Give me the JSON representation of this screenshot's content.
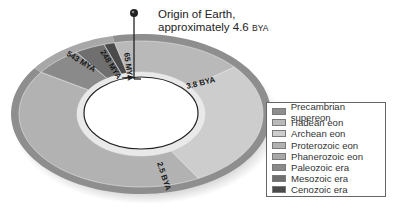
{
  "callout": {
    "line1": "Origin of Earth,",
    "line2_main": "approximately 4.6 ",
    "line2_unit": "BYA"
  },
  "ring_labels": {
    "mya543": "543 MYA",
    "mya248": "248 MYA",
    "mya65": "65 MYA",
    "bya38": "3.8 BYA",
    "bya25": "2.5 BYA"
  },
  "legend": {
    "items": [
      {
        "label": "Precambrian supereon",
        "color": "#8e8e8e"
      },
      {
        "label": "Hadean eon",
        "color": "#b9b9b9"
      },
      {
        "label": "Archean eon",
        "color": "#cdcdcd"
      },
      {
        "label": "Proterozoic eon",
        "color": "#b2b2b2"
      },
      {
        "label": "Phanerozoic eon",
        "color": "#a8a8a8"
      },
      {
        "label": "Paleozoic era",
        "color": "#8a8a8a"
      },
      {
        "label": "Mesozoic era",
        "color": "#6f6f6f"
      },
      {
        "label": "Cenozoic era",
        "color": "#4a4a4a"
      }
    ]
  },
  "geometry": {
    "cx": 141,
    "cy": 114,
    "outer_rx": 130,
    "outer_ry": 80,
    "band_rx": 122,
    "band_ry": 73,
    "inner_rx": 64,
    "inner_ry": 42,
    "hole_rx": 57,
    "hole_ry": 36
  },
  "segments": [
    {
      "name": "hadean",
      "start": 0,
      "end": 0.174,
      "color": "#b9b9b9"
    },
    {
      "name": "archean",
      "start": 0.174,
      "end": 0.457,
      "color": "#cdcdcd"
    },
    {
      "name": "proterozoic",
      "start": 0.457,
      "end": 0.882,
      "color": "#b2b2b2"
    },
    {
      "name": "paleozoic",
      "start": 0.882,
      "end": 0.946,
      "color": "#8a8a8a"
    },
    {
      "name": "mesozoic",
      "start": 0.946,
      "end": 0.986,
      "color": "#6f6f6f"
    },
    {
      "name": "cenozoic",
      "start": 0.986,
      "end": 1.0,
      "color": "#4a4a4a"
    }
  ],
  "outer_bands": [
    {
      "name": "precambrian",
      "start": 0,
      "end": 0.882,
      "color": "#8e8e8e"
    },
    {
      "name": "phanerozoic",
      "start": 0.882,
      "end": 1.0,
      "color": "#a8a8a8"
    }
  ]
}
